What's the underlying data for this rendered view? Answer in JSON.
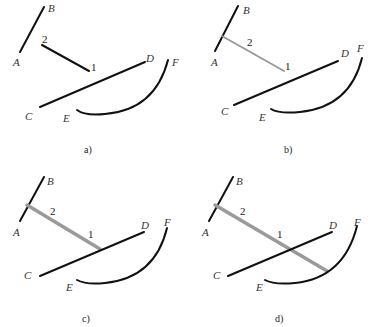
{
  "figure": {
    "panels": [
      {
        "caption": "a)",
        "labels": {
          "A": "A",
          "B": "B",
          "C": "C",
          "D": "D",
          "E": "E",
          "F": "F",
          "p1": "1",
          "p2": "2"
        },
        "description": "Three curves AB, CD, EF and a free segment 2-1"
      },
      {
        "caption": "b)",
        "labels": {
          "A": "A",
          "B": "B",
          "C": "C",
          "D": "D",
          "E": "E",
          "F": "F",
          "p1": "1",
          "p2": "2"
        },
        "description": "Segment starts on line AB (perpendicular), shown in gray"
      },
      {
        "caption": "c)",
        "labels": {
          "A": "A",
          "B": "B",
          "C": "C",
          "D": "D",
          "E": "E",
          "F": "F",
          "p1": "1",
          "p2": "2"
        },
        "description": "Segment extended to intersect line CD"
      },
      {
        "caption": "d)",
        "labels": {
          "A": "A",
          "B": "B",
          "C": "C",
          "D": "D",
          "E": "E",
          "F": "F",
          "p1": "1",
          "p2": "2"
        },
        "description": "Segment extended past CD to meet arc EF"
      }
    ],
    "colors": {
      "line": "#111111",
      "highlight": "#999999"
    }
  }
}
